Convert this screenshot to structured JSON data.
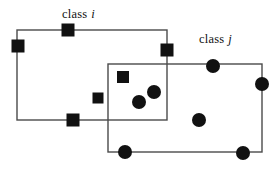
{
  "figure": {
    "type": "diagram",
    "width": 280,
    "height": 172,
    "background_color": "#ffffff",
    "stroke_color": "#4a4a4a",
    "marker_color": "#111111",
    "stroke_width": 1.4
  },
  "labels": {
    "class_i": {
      "text": "class",
      "variable": "i"
    },
    "class_j": {
      "text": "class",
      "variable": "j"
    }
  },
  "boxes": [
    {
      "id": "box-class-i",
      "label": "class i",
      "marker_shape": "square",
      "x": 17,
      "y": 30,
      "width": 150,
      "height": 90
    },
    {
      "id": "box-class-j",
      "label": "class j",
      "marker_shape": "circle",
      "x": 108,
      "y": 64,
      "width": 154,
      "height": 88
    }
  ],
  "markers": {
    "squares": [
      {
        "cx": 68,
        "cy": 30,
        "size": 13,
        "on_boundary": true
      },
      {
        "cx": 18,
        "cy": 46,
        "size": 13,
        "on_boundary": true
      },
      {
        "cx": 167,
        "cy": 50,
        "size": 13,
        "on_boundary": true
      },
      {
        "cx": 123,
        "cy": 77,
        "size": 12,
        "on_boundary": false
      },
      {
        "cx": 98,
        "cy": 98,
        "size": 11,
        "on_boundary": false
      },
      {
        "cx": 73,
        "cy": 120,
        "size": 13,
        "on_boundary": true
      }
    ],
    "circles": [
      {
        "cx": 213,
        "cy": 66,
        "r": 7,
        "on_boundary": true
      },
      {
        "cx": 262,
        "cy": 84,
        "r": 7,
        "on_boundary": true
      },
      {
        "cx": 154,
        "cy": 92,
        "r": 7,
        "on_boundary": false
      },
      {
        "cx": 139,
        "cy": 102,
        "r": 7,
        "on_boundary": false
      },
      {
        "cx": 199,
        "cy": 120,
        "r": 7,
        "on_boundary": false
      },
      {
        "cx": 125,
        "cy": 152,
        "r": 7,
        "on_boundary": true
      },
      {
        "cx": 243,
        "cy": 153,
        "r": 7,
        "on_boundary": true
      }
    ]
  }
}
